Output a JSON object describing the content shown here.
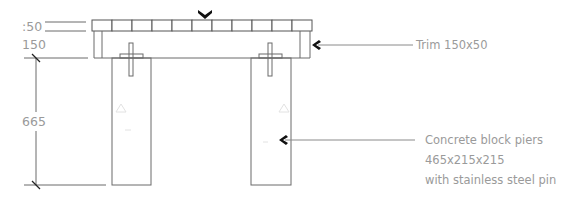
{
  "dimensions": {
    "top_board": ":50",
    "frame": "150",
    "pier_height": "665"
  },
  "callouts": [
    {
      "id": "trim",
      "lines": [
        "Trim 150x50"
      ]
    },
    {
      "id": "piers",
      "lines": [
        "Concrete block piers",
        "465x215x215",
        "with stainless steel pin"
      ]
    }
  ],
  "deck": {
    "board_count": 11
  },
  "colors": {
    "line": "#6a6a6a",
    "text": "#9a9a9a",
    "arrow": "#111111"
  }
}
